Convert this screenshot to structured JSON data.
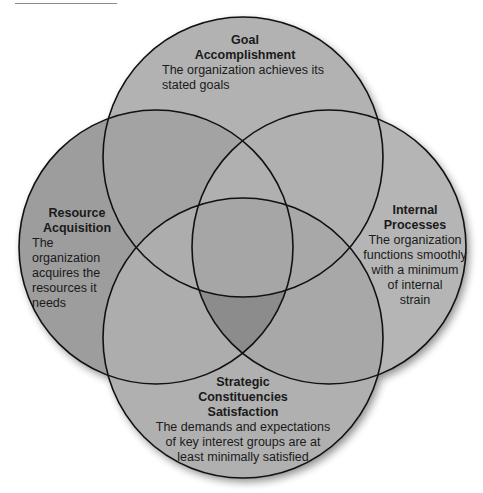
{
  "figure": {
    "type": "four-circle venn diagram",
    "colors": {
      "circle_fill_top": "#b2b2b2",
      "circle_fill_left": "#9d9d9d",
      "circle_fill_right": "#b5b5b5",
      "circle_fill_bottom": "#b0b0b0",
      "overlap_highlight": "#8a8a8a",
      "stroke": "#111111"
    }
  },
  "circles": [
    {
      "id": "goal",
      "title_line1": "Goal",
      "title_line2": "Accomplishment",
      "desc_line1": "The organization achieves its",
      "desc_line2": "stated goals"
    },
    {
      "id": "resource",
      "title_line1": "Resource",
      "title_line2": "Acquisition",
      "desc_line1": "The organization",
      "desc_line2": "acquires the",
      "desc_line3": "resources it",
      "desc_line4": "needs"
    },
    {
      "id": "internal",
      "title_line1": "Internal",
      "title_line2": "Processes",
      "desc_line1": "The organization",
      "desc_line2": "functions smoothly",
      "desc_line3": "with a minimum",
      "desc_line4": "of internal",
      "desc_line5": "strain"
    },
    {
      "id": "strategic",
      "title_line1": "Strategic",
      "title_line2": "Constituencies",
      "title_line3": "Satisfaction",
      "desc_line1": "The demands and expectations",
      "desc_line2": "of key interest groups are at",
      "desc_line3": "least minimally satisfied"
    }
  ]
}
